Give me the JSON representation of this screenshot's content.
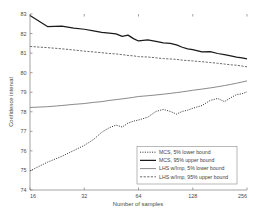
{
  "chart_data": {
    "type": "line",
    "title": "",
    "xlabel": "Number of samples",
    "ylabel": "Confidence interval",
    "xscale": "log2",
    "xlim": [
      16,
      256
    ],
    "ylim": [
      74,
      83
    ],
    "xticks": [
      16,
      32,
      64,
      128,
      256
    ],
    "xtick_labels": [
      "16",
      "32",
      "64",
      "128",
      "256"
    ],
    "yticks": [
      74,
      75,
      76,
      77,
      78,
      79,
      80,
      81,
      82,
      83
    ],
    "ytick_labels": [
      "74",
      "75",
      "76",
      "77",
      "78",
      "79",
      "80",
      "81",
      "82",
      "83"
    ],
    "grid": false,
    "legend_position": "lower right",
    "x": [
      16,
      20,
      24,
      28,
      32,
      36,
      40,
      44,
      48,
      52,
      56,
      60,
      64,
      72,
      80,
      88,
      96,
      104,
      112,
      120,
      128,
      144,
      160,
      176,
      192,
      208,
      224,
      240,
      256
    ],
    "series": [
      {
        "name": "MCS, 5% lower bound",
        "style": "dotted",
        "color": "#262626",
        "width": 0.9,
        "values": [
          74.98,
          75.42,
          75.72,
          76.02,
          76.28,
          76.58,
          76.95,
          77.18,
          77.32,
          77.22,
          77.42,
          77.52,
          77.58,
          77.72,
          78.02,
          78.12,
          78.02,
          77.88,
          78.02,
          78.08,
          78.18,
          78.32,
          78.58,
          78.68,
          78.52,
          78.72,
          78.88,
          78.92,
          79.02
        ]
      },
      {
        "name": "MCS, 95% upper bound",
        "style": "solid",
        "color": "#1a1a1a",
        "width": 1.25,
        "values": [
          82.92,
          82.36,
          82.38,
          82.28,
          82.22,
          82.14,
          82.06,
          82.02,
          81.98,
          81.86,
          81.92,
          81.74,
          81.62,
          81.68,
          81.6,
          81.52,
          81.5,
          81.42,
          81.3,
          81.22,
          81.18,
          81.06,
          81.08,
          80.98,
          80.92,
          80.86,
          80.8,
          80.76,
          80.7
        ]
      },
      {
        "name": "LHS w/Imp, 5% lower bound",
        "style": "solid",
        "color": "#585858",
        "width": 0.7,
        "values": [
          78.22,
          78.26,
          78.32,
          78.38,
          78.42,
          78.48,
          78.52,
          78.58,
          78.62,
          78.66,
          78.7,
          78.74,
          78.78,
          78.82,
          78.86,
          78.9,
          78.94,
          78.98,
          79.02,
          79.06,
          79.1,
          79.16,
          79.22,
          79.28,
          79.34,
          79.4,
          79.46,
          79.52,
          79.58
        ]
      },
      {
        "name": "LHS w/Imp, 95% upper bound",
        "style": "dashed",
        "color": "#444444",
        "width": 0.8,
        "values": [
          81.34,
          81.28,
          81.22,
          81.16,
          81.1,
          81.06,
          81.02,
          80.98,
          80.96,
          80.92,
          80.88,
          80.86,
          80.82,
          80.8,
          80.76,
          80.72,
          80.7,
          80.68,
          80.64,
          80.62,
          80.6,
          80.56,
          80.52,
          80.48,
          80.44,
          80.4,
          80.38,
          80.34,
          80.3
        ]
      }
    ]
  },
  "legend": {
    "entries": [
      "MCS, 5% lower bound",
      "MCS, 95% upper bound",
      "LHS w/Imp, 5% lower bound",
      "LHS w/Imp, 95% upper bound"
    ]
  },
  "axes": {
    "y_title": "Confidence interval",
    "x_title": "Number of samples"
  }
}
